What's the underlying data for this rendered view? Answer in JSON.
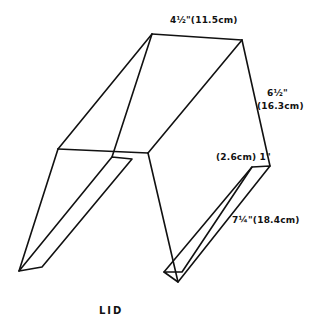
{
  "diagram": {
    "title": "LID",
    "dimensions": {
      "top_width": "4½\"(11.5cm)",
      "side_height_in": "6½\"",
      "side_height_cm": "(16.3cm)",
      "flap_depth": "(2.6cm) 1\"",
      "flap_length": "7¼\"(18.4cm)"
    },
    "colors": {
      "line": "#111111",
      "background": "#ffffff"
    }
  }
}
